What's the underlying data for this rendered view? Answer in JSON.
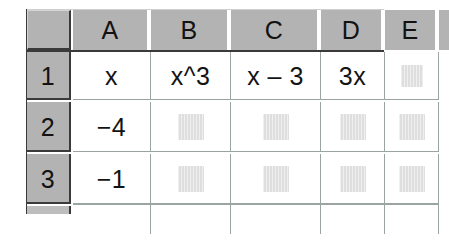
{
  "app": {
    "type": "spreadsheet",
    "description": "Spreadsheet grid with column headers A through E and row headers 1 through 3"
  },
  "colors": {
    "header_gray": "#b3b3b3",
    "cell_background": "#ffffff",
    "gridline": "#9aa5a0",
    "header_border": "#3a3a3a",
    "text": "#131313",
    "redacted_block": "#d9d9d9"
  },
  "grid": {
    "select_all_label": "",
    "column_headers": [
      {
        "label": "A",
        "left": 47,
        "width": 76
      },
      {
        "label": "B",
        "left": 125,
        "width": 78
      },
      {
        "label": "C",
        "left": 205,
        "width": 88
      },
      {
        "label": "D",
        "left": 295,
        "width": 62
      },
      {
        "label": "E",
        "left": 359,
        "width": 52
      },
      {
        "label": "",
        "left": 413,
        "width": 10
      }
    ],
    "row_headers": [
      {
        "label": "1",
        "top": 43,
        "height": 48
      },
      {
        "label": "2",
        "top": 93,
        "height": 50
      },
      {
        "label": "3",
        "top": 145,
        "height": 50
      },
      {
        "label": "",
        "top": 197,
        "height": 8
      }
    ],
    "rows": [
      {
        "row": "1",
        "cells": [
          {
            "column": "A",
            "value": "x",
            "redacted": false
          },
          {
            "column": "B",
            "value": "x^3",
            "redacted": false
          },
          {
            "column": "C",
            "value": "x – 3",
            "redacted": false
          },
          {
            "column": "D",
            "value": "3x",
            "redacted": false
          },
          {
            "column": "E",
            "value": "",
            "redacted": true
          }
        ]
      },
      {
        "row": "2",
        "cells": [
          {
            "column": "A",
            "value": "−4",
            "redacted": false
          },
          {
            "column": "B",
            "value": "",
            "redacted": true
          },
          {
            "column": "C",
            "value": "",
            "redacted": true
          },
          {
            "column": "D",
            "value": "",
            "redacted": true
          },
          {
            "column": "E",
            "value": "",
            "redacted": true
          }
        ]
      },
      {
        "row": "3",
        "cells": [
          {
            "column": "A",
            "value": "−1",
            "redacted": false
          },
          {
            "column": "B",
            "value": "",
            "redacted": true
          },
          {
            "column": "C",
            "value": "",
            "redacted": true
          },
          {
            "column": "D",
            "value": "",
            "redacted": true
          },
          {
            "column": "E",
            "value": "",
            "redacted": true
          }
        ]
      }
    ]
  }
}
